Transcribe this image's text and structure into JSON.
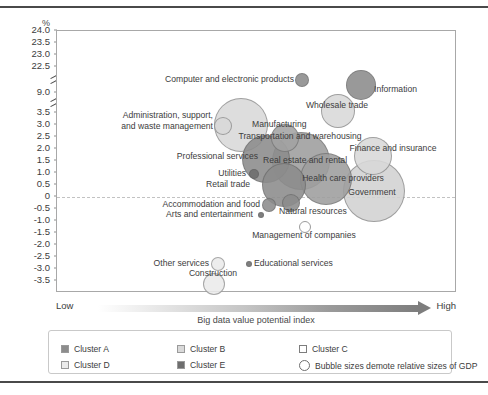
{
  "axes": {
    "y_unit": "%",
    "y_ticks": [
      "24.0",
      "23.5",
      "23.0",
      "22.5",
      "9.0",
      "3.5",
      "3.0",
      "2.5",
      "2.0",
      "1.5",
      "1.0",
      "0.5",
      "0",
      "-0.5",
      "-1.0",
      "-1.5",
      "-2.0",
      "-2.5",
      "-3.0",
      "-3.5"
    ],
    "x_low": "Low",
    "x_high": "High",
    "x_title": "Big data value potential index"
  },
  "legend": {
    "items": [
      {
        "label": "Cluster A",
        "color": "#8c8c8c",
        "shape": "square"
      },
      {
        "label": "Cluster B",
        "color": "#d9d9d9",
        "shape": "square"
      },
      {
        "label": "Cluster C",
        "color": "#ffffff",
        "shape": "square"
      },
      {
        "label": "Cluster D",
        "color": "#ebebeb",
        "shape": "square"
      },
      {
        "label": "Cluster E",
        "color": "#6e6e6e",
        "shape": "square"
      },
      {
        "label": "Bubble sizes demote relative sizes of GDP",
        "color": "#ffffff",
        "shape": "circle"
      }
    ]
  },
  "chart_data": {
    "type": "scatter",
    "title": "",
    "xlabel": "Big data value potential index",
    "ylabel": "%",
    "grid": false,
    "legend_position": "bottom",
    "note": "Bubble area encodes relative size of GDP; y axis has two scale breaks between 22.5-9.0 and 9.0-3.5",
    "ylim": [
      -3.5,
      24.0
    ],
    "points": [
      {
        "label": "Computer and electronic products",
        "y": 22.5,
        "size": 7,
        "color": "#8c8c8c",
        "cluster": "A"
      },
      {
        "label": "Information",
        "y": 22.0,
        "size": 15,
        "color": "#8c8c8c",
        "cluster": "A"
      },
      {
        "label": "Administration, support, and waste management",
        "y": 3.0,
        "size": 9,
        "color": "#d9d9d9",
        "cluster": "B"
      },
      {
        "label": "Manufacturing",
        "y": 2.9,
        "size": 27,
        "color": "#d9d9d9",
        "cluster": "B"
      },
      {
        "label": "Wholesale trade",
        "y": 2.4,
        "size": 17,
        "color": "#d9d9d9",
        "cluster": "B"
      },
      {
        "label": "Transportation and warehousing",
        "y": 2.3,
        "size": 14,
        "color": "#a3a3a3",
        "cluster": "A"
      },
      {
        "label": "Finance and insurance",
        "y": 1.9,
        "size": 19,
        "color": "#d9d9d9",
        "cluster": "B"
      },
      {
        "label": "Professional services",
        "y": 1.6,
        "size": 24,
        "color": "#8c8c8c",
        "cluster": "A"
      },
      {
        "label": "Real estate and rental",
        "y": 1.5,
        "size": 29,
        "color": "#9e9e9e",
        "cluster": "A"
      },
      {
        "label": "Utilities",
        "y": 0.9,
        "size": 5,
        "color": "#6e6e6e",
        "cluster": "E"
      },
      {
        "label": "Health care providers",
        "y": 0.7,
        "size": 26,
        "color": "#9e9e9e",
        "cluster": "A"
      },
      {
        "label": "Retail trade",
        "y": 0.5,
        "size": 22,
        "color": "#8c8c8c",
        "cluster": "A"
      },
      {
        "label": "Government",
        "y": 0.1,
        "size": 31,
        "color": "#d2d2d2",
        "cluster": "B"
      },
      {
        "label": "Accommodation and food",
        "y": -0.4,
        "size": 7,
        "color": "#8c8c8c",
        "cluster": "A"
      },
      {
        "label": "Natural resources",
        "y": -0.3,
        "size": 9,
        "color": "#8c8c8c",
        "cluster": "A"
      },
      {
        "label": "Arts and entertainment",
        "y": -0.7,
        "size": 3,
        "color": "#6e6e6e",
        "cluster": "E"
      },
      {
        "label": "Management of companies",
        "y": -1.3,
        "size": 6,
        "color": "#ffffff",
        "cluster": "C"
      },
      {
        "label": "Educational services",
        "y": -2.6,
        "size": 3,
        "color": "#6e6e6e",
        "cluster": "E"
      },
      {
        "label": "Other services",
        "y": -2.6,
        "size": 7,
        "color": "#ebebeb",
        "cluster": "D"
      },
      {
        "label": "Construction",
        "y": -3.3,
        "size": 11,
        "color": "#ebebeb",
        "cluster": "D"
      }
    ]
  }
}
